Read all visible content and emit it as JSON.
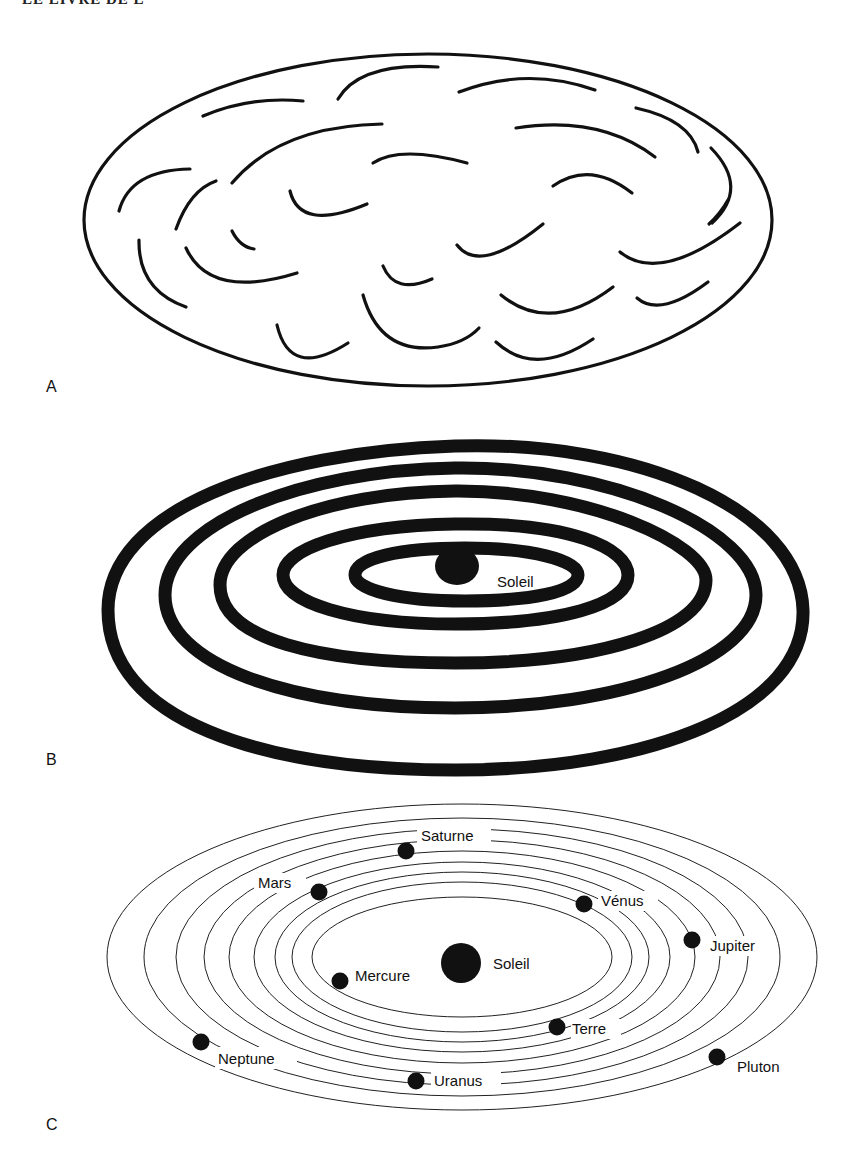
{
  "page": {
    "header_fragment": "LE LIVRE DE L"
  },
  "panels": [
    {
      "id": "A",
      "label": "A",
      "description": "Nuage (nébuleuse) de gaz et poussières en forme d'ellipse"
    },
    {
      "id": "B",
      "label": "B",
      "description": "Anneaux concentriques autour du Soleil",
      "sun_label": "Soleil",
      "ring_count": 5
    },
    {
      "id": "C",
      "label": "C",
      "description": "Système solaire: planètes sur leurs orbites",
      "sun_label": "Soleil",
      "orbit_count": 9,
      "planets": [
        {
          "name": "Mercure"
        },
        {
          "name": "Vénus"
        },
        {
          "name": "Terre"
        },
        {
          "name": "Mars"
        },
        {
          "name": "Jupiter"
        },
        {
          "name": "Saturne"
        },
        {
          "name": "Uranus"
        },
        {
          "name": "Neptune"
        },
        {
          "name": "Pluton"
        }
      ]
    }
  ],
  "colors": {
    "ink": "#111111",
    "background": "#ffffff"
  }
}
